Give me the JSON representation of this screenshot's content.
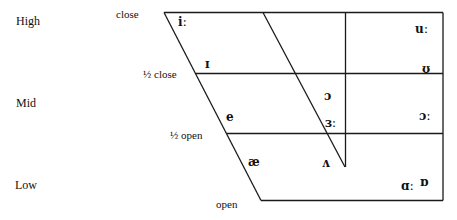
{
  "diagram": {
    "type": "vowel-quadrilateral",
    "colors": {
      "line": "#1a1a1a",
      "text": "#111111",
      "background": "#ffffff"
    },
    "height_labels": [
      {
        "id": "high",
        "text": "High"
      },
      {
        "id": "mid",
        "text": "Mid"
      },
      {
        "id": "low",
        "text": "Low"
      }
    ],
    "openness_labels": [
      {
        "id": "close",
        "text": "close"
      },
      {
        "id": "half-close",
        "text": "½ close"
      },
      {
        "id": "half-open",
        "text": "½ open"
      },
      {
        "id": "open",
        "text": "open"
      }
    ],
    "vowels": [
      {
        "id": "i-long",
        "symbol": "iː"
      },
      {
        "id": "short-i",
        "symbol": "ɪ"
      },
      {
        "id": "e",
        "symbol": "e"
      },
      {
        "id": "ae",
        "symbol": "æ"
      },
      {
        "id": "u-long",
        "symbol": "uː"
      },
      {
        "id": "short-u",
        "symbol": "ʊ"
      },
      {
        "id": "schwa-open-o",
        "symbol": "ɔ"
      },
      {
        "id": "er-long",
        "symbol": "ɜː"
      },
      {
        "id": "aw-long",
        "symbol": "ɔː"
      },
      {
        "id": "wedge",
        "symbol": "ʌ"
      },
      {
        "id": "a-long",
        "symbol": "ɑː"
      },
      {
        "id": "short-o",
        "symbol": "ɒ"
      }
    ]
  }
}
